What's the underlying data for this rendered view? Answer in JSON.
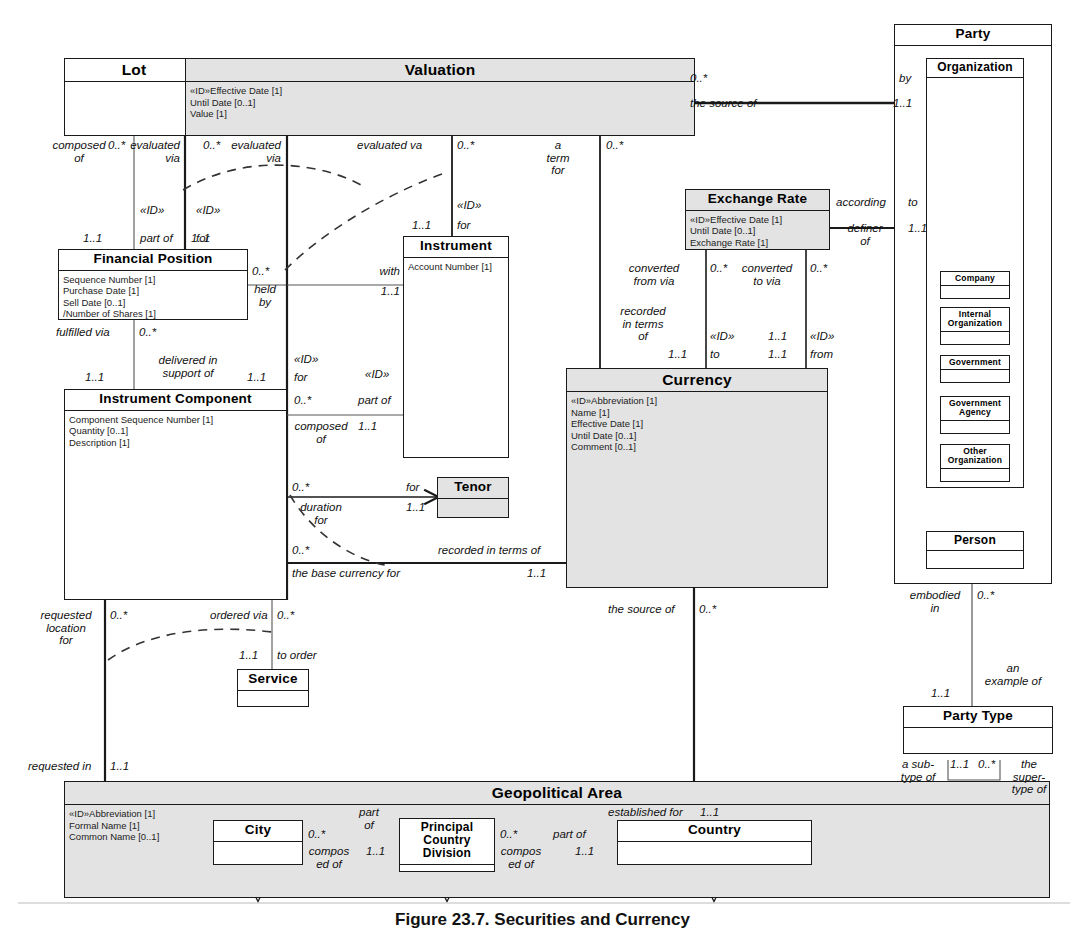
{
  "diagram": {
    "caption": "Figure 23.7. Securities and Currency",
    "colors": {
      "line": "#1a1a1a",
      "shaded_fill": "#e3e3e3",
      "plain_fill": "#ffffff",
      "text": "#111111"
    }
  },
  "classes": {
    "lot": {
      "name": "Lot",
      "attributes": []
    },
    "valuation": {
      "name": "Valuation",
      "attributes": [
        "«ID»Effective Date [1]",
        "Until Date [0..1]",
        "Value [1]"
      ]
    },
    "financial_position": {
      "name": "Financial Position",
      "attributes": [
        "Sequence Number [1]",
        "Purchase Date [1]",
        "Sell Date [0..1]",
        "/Number of Shares [1]"
      ]
    },
    "instrument": {
      "name": "Instrument",
      "attributes": [
        "Account Number [1]"
      ]
    },
    "instrument_component": {
      "name": "Instrument Component",
      "attributes": [
        "Component Sequence Number [1]",
        "Quantity [0..1]",
        "Description [1]"
      ]
    },
    "tenor": {
      "name": "Tenor",
      "attributes": []
    },
    "service": {
      "name": "Service",
      "attributes": []
    },
    "currency": {
      "name": "Currency",
      "attributes": [
        "«ID»Abbreviation [1]",
        "Name [1]",
        "Effective Date [1]",
        "Until Date [0..1]",
        "Comment [0..1]"
      ]
    },
    "exchange_rate": {
      "name": "Exchange Rate",
      "attributes": [
        "«ID»Effective Date [1]",
        "Until Date [0..1]",
        "Exchange Rate [1]"
      ]
    },
    "party": {
      "name": "Party",
      "attributes": []
    },
    "organization": {
      "name": "Organization",
      "attributes": []
    },
    "company": {
      "name": "Company",
      "attributes": []
    },
    "internal_organization": {
      "name": "Internal\nOrganization",
      "attributes": []
    },
    "government": {
      "name": "Government",
      "attributes": []
    },
    "government_agency": {
      "name": "Government\nAgency",
      "attributes": []
    },
    "other_organization": {
      "name": "Other\nOrganization",
      "attributes": []
    },
    "person": {
      "name": "Person",
      "attributes": []
    },
    "party_type": {
      "name": "Party Type",
      "attributes": []
    },
    "geopolitical_area": {
      "name": "Geopolitical Area",
      "attributes": [
        "«ID»Abbreviation [1]",
        "Formal Name [1]",
        "Common Name [0..1]"
      ]
    },
    "city": {
      "name": "City",
      "attributes": []
    },
    "principal_country_division": {
      "name": "Principal\nCountry\nDivision",
      "attributes": []
    },
    "country": {
      "name": "Country",
      "attributes": []
    }
  },
  "labels": {
    "composed_of": "composed\nof",
    "evaluated_via_1_mult": "0..*",
    "evaluated_via_1": "evaluated\nvia",
    "part_of_mult": "1..1",
    "part_of_id": "«ID»",
    "part_of": "part of",
    "evaluated_via_2_mult": "0..*",
    "evaluated_via_2": "evaluated\nvia",
    "for_mult_1": "1..1",
    "for_id_1": "«ID»",
    "for_1": "for",
    "evaluated_va": "evaluated va",
    "instr_mult": "0..*",
    "instr_for_mult": "1..1",
    "instr_for_id": "«ID»",
    "instr_for": "for",
    "a_term_for": "a\nterm\nfor",
    "a_term_for_mult": "0..*",
    "valuation_source_mult": "0..*",
    "the_source_of": "the source of",
    "by": "by",
    "by_mult": "1..1",
    "held_by_mult": "0..*",
    "held_by": "held\nby",
    "with": "with",
    "with_mult": "1..1",
    "fulfilled_via": "fulfilled via",
    "fulfilled_via_mult": "0..*",
    "delivered_in_support_of": "delivered in\nsupport of",
    "delivered_mult": "1..1",
    "ic_for_id": "«ID»",
    "ic_for": "for",
    "ic_for_mult": "1..1",
    "composed_of_2_mult": "0..*",
    "composed_of_2": "composed\nof",
    "part_of_2_id": "«ID»",
    "part_of_2": "part of",
    "part_of_2_mult": "1..1",
    "tenor_for": "for",
    "tenor_mult_src": "0..*",
    "tenor_mult_dst": "1..1",
    "duration_for": "duration\nfor",
    "recorded_in_terms_of": "recorded in terms of",
    "recorded_mult_src": "0..*",
    "recorded_mult_dst": "1..1",
    "the_base_currency_for": "the base currency for",
    "requested_location_for": "requested\nlocation\nfor",
    "requested_location_mult": "0..*",
    "ordered_via": "ordered via",
    "ordered_via_mult": "0..*",
    "to_order": "to order",
    "to_order_mult": "1..1",
    "requested_in": "requested in",
    "requested_in_mult": "1..1",
    "converted_from_via": "converted\nfrom via",
    "converted_from_mult": "0..*",
    "converted_to_via": "converted\nto via",
    "converted_to_mult": "0..*",
    "recorded_in_terms_of_2": "recorded\nin terms\nof",
    "recorded2_mult": "1..1",
    "to_id": "«ID»",
    "to": "to",
    "to_mult": "1..1",
    "from_id": "«ID»",
    "from": "from",
    "from_mult": "1..1",
    "according": "according",
    "according_to": "to",
    "definer_of": "definer\nof",
    "definer_mult": "1..1",
    "currency_source_of": "the source of",
    "currency_source_mult": "0..*",
    "embodied_in": "embodied\nin",
    "embodied_in_mult": "0..*",
    "an_example_of": "an\nexample of",
    "an_example_of_mult": "1..1",
    "a_subtype_of": "a sub-\ntype of",
    "a_subtype_mult": "1..1",
    "the_supertype_of": "the\nsuper-\ntype of",
    "the_supertype_mult": "0..*",
    "city_mult": "0..*",
    "city_part_of": "part\nof",
    "city_composed_of": "compos\ned of",
    "city_part_mult": "1..1",
    "pcd_mult": "0..*",
    "pcd_part_of": "part of",
    "pcd_composed_of": "compos\ned of",
    "pcd_part_mult": "1..1",
    "established_for": "established for",
    "established_for_mult": "1..1"
  }
}
